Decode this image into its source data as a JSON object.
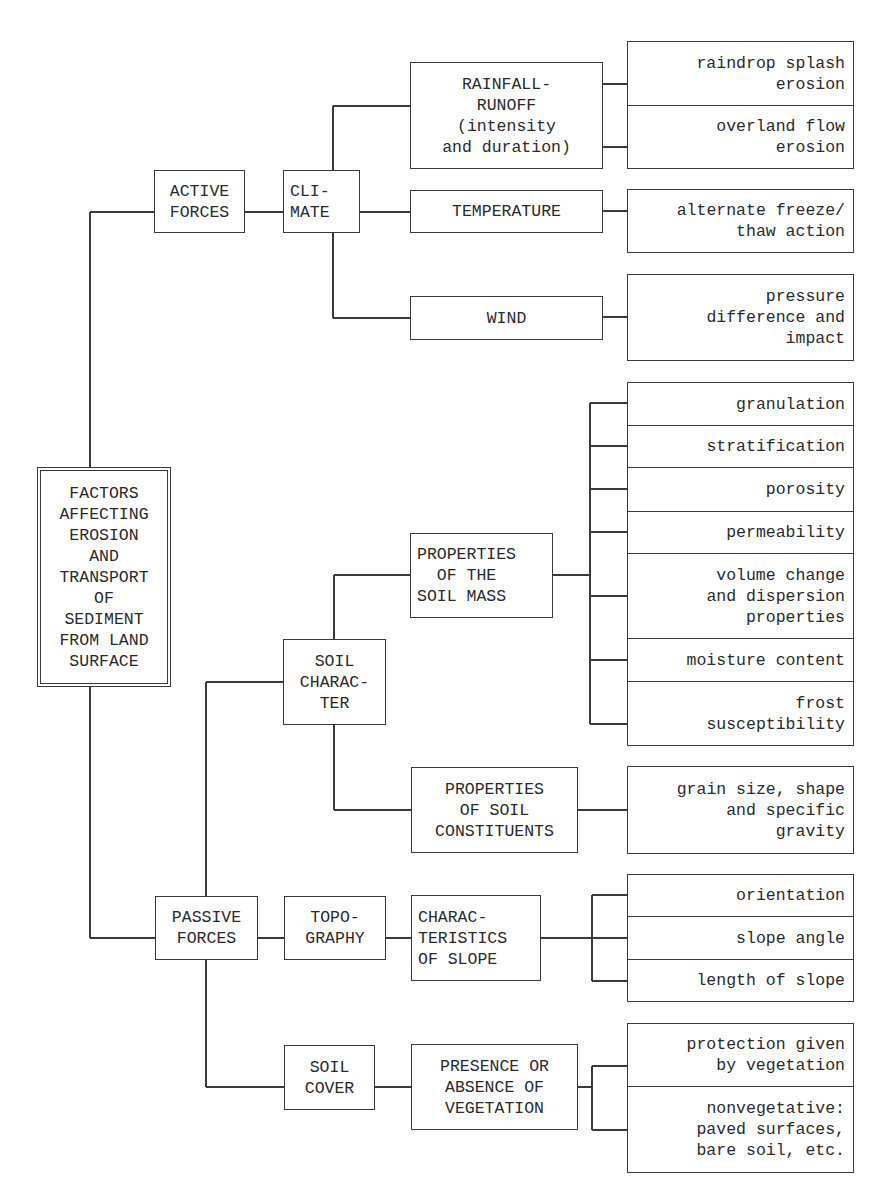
{
  "diagram": {
    "colors": {
      "line": "#3a3a3a",
      "text": "#2a2a2a",
      "background": "#ffffff"
    },
    "nodes": [
      {
        "id": "root",
        "align": "center",
        "double": true,
        "x": 37,
        "y": 467,
        "w": 134,
        "h": 220,
        "lines": [
          "FACTORS",
          "AFFECTING",
          "EROSION",
          "AND",
          "TRANSPORT",
          "OF",
          "SEDIMENT",
          "FROM LAND",
          "SURFACE"
        ]
      },
      {
        "id": "active-forces",
        "align": "center",
        "x": 154,
        "y": 170,
        "w": 91,
        "h": 63,
        "lines": [
          "ACTIVE",
          "FORCES"
        ]
      },
      {
        "id": "climate",
        "align": "left",
        "x": 283,
        "y": 170,
        "w": 77,
        "h": 63,
        "lines": [
          "CLI-",
          "MATE"
        ]
      },
      {
        "id": "rainfall-runoff",
        "align": "center",
        "x": 410,
        "y": 62,
        "w": 193,
        "h": 107,
        "lines": [
          "RAINFALL-",
          "RUNOFF",
          "(intensity",
          "and duration)"
        ]
      },
      {
        "id": "temperature",
        "align": "center",
        "x": 410,
        "y": 190,
        "w": 193,
        "h": 43,
        "lines": [
          "TEMPERATURE"
        ]
      },
      {
        "id": "wind",
        "align": "center",
        "x": 410,
        "y": 296,
        "w": 193,
        "h": 44,
        "lines": [
          "WIND"
        ]
      },
      {
        "id": "raindrop-splash",
        "align": "right",
        "x": 627,
        "y": 41,
        "w": 227,
        "h": 65,
        "lines": [
          "raindrop splash",
          "erosion"
        ]
      },
      {
        "id": "overland-flow",
        "align": "right",
        "x": 627,
        "y": 105,
        "w": 227,
        "h": 64,
        "lines": [
          "overland flow",
          "erosion"
        ]
      },
      {
        "id": "freeze-thaw",
        "align": "right",
        "x": 627,
        "y": 189,
        "w": 227,
        "h": 64,
        "lines": [
          "alternate freeze/",
          "thaw action"
        ]
      },
      {
        "id": "pressure-difference",
        "align": "right",
        "x": 627,
        "y": 274,
        "w": 227,
        "h": 87,
        "lines": [
          "pressure",
          "difference and",
          "impact"
        ]
      },
      {
        "id": "passive-forces",
        "align": "center",
        "x": 155,
        "y": 896,
        "w": 103,
        "h": 64,
        "lines": [
          "PASSIVE",
          "FORCES"
        ]
      },
      {
        "id": "soil-character",
        "align": "center",
        "x": 283,
        "y": 639,
        "w": 103,
        "h": 86,
        "lines": [
          "SOIL",
          "CHARAC-",
          "TER"
        ]
      },
      {
        "id": "soil-mass",
        "align": "left",
        "x": 410,
        "y": 533,
        "w": 143,
        "h": 85,
        "lines": [
          "PROPERTIES",
          "  OF THE",
          "SOIL MASS"
        ]
      },
      {
        "id": "soil-constituents",
        "align": "center",
        "x": 411,
        "y": 767,
        "w": 167,
        "h": 86,
        "lines": [
          "PROPERTIES",
          "OF SOIL",
          "CONSTITUENTS"
        ]
      },
      {
        "id": "granulation",
        "align": "right",
        "x": 627,
        "y": 382,
        "w": 227,
        "h": 44,
        "lines": [
          "granulation"
        ]
      },
      {
        "id": "stratification",
        "align": "right",
        "x": 627,
        "y": 425,
        "w": 227,
        "h": 43,
        "lines": [
          "stratification"
        ]
      },
      {
        "id": "porosity",
        "align": "right",
        "x": 627,
        "y": 467,
        "w": 227,
        "h": 45,
        "lines": [
          "porosity"
        ]
      },
      {
        "id": "permeability",
        "align": "right",
        "x": 627,
        "y": 511,
        "w": 227,
        "h": 43,
        "lines": [
          "permeability"
        ]
      },
      {
        "id": "volume-change",
        "align": "right",
        "x": 627,
        "y": 553,
        "w": 227,
        "h": 86,
        "lines": [
          "volume change",
          "and dispersion",
          "properties"
        ]
      },
      {
        "id": "moisture-content",
        "align": "right",
        "x": 627,
        "y": 638,
        "w": 227,
        "h": 44,
        "lines": [
          "moisture content"
        ]
      },
      {
        "id": "frost-susceptibility",
        "align": "right",
        "x": 627,
        "y": 681,
        "w": 227,
        "h": 65,
        "lines": [
          "frost",
          "susceptibility"
        ]
      },
      {
        "id": "grain-size",
        "align": "right",
        "x": 627,
        "y": 766,
        "w": 227,
        "h": 88,
        "lines": [
          "grain size, shape",
          "and specific",
          "gravity"
        ]
      },
      {
        "id": "topography",
        "align": "center",
        "x": 284,
        "y": 896,
        "w": 102,
        "h": 64,
        "lines": [
          "TOPO-",
          "GRAPHY"
        ]
      },
      {
        "id": "slope-characteristics",
        "align": "left",
        "x": 411,
        "y": 895,
        "w": 130,
        "h": 86,
        "lines": [
          "CHARAC-",
          "TERISTICS",
          "OF SLOPE"
        ]
      },
      {
        "id": "orientation",
        "align": "right",
        "x": 627,
        "y": 874,
        "w": 227,
        "h": 43,
        "lines": [
          "orientation"
        ]
      },
      {
        "id": "slope-angle",
        "align": "right",
        "x": 627,
        "y": 916,
        "w": 227,
        "h": 44,
        "lines": [
          "slope angle"
        ]
      },
      {
        "id": "length-of-slope",
        "align": "right",
        "x": 627,
        "y": 959,
        "w": 227,
        "h": 43,
        "lines": [
          "length of slope"
        ]
      },
      {
        "id": "soil-cover",
        "align": "center",
        "x": 284,
        "y": 1045,
        "w": 91,
        "h": 65,
        "lines": [
          "SOIL",
          "COVER"
        ]
      },
      {
        "id": "vegetation-presence",
        "align": "center",
        "x": 411,
        "y": 1044,
        "w": 167,
        "h": 86,
        "lines": [
          "PRESENCE OR",
          "ABSENCE OF",
          "VEGETATION"
        ]
      },
      {
        "id": "protection-by-vegetation",
        "align": "right",
        "x": 627,
        "y": 1023,
        "w": 227,
        "h": 64,
        "lines": [
          "protection given",
          "by vegetation"
        ]
      },
      {
        "id": "nonvegetative",
        "align": "right",
        "x": 627,
        "y": 1086,
        "w": 227,
        "h": 87,
        "lines": [
          "nonvegetative:",
          "paved surfaces,",
          "bare soil, etc."
        ]
      }
    ],
    "lines": [
      {
        "type": "v",
        "x": 90,
        "y1": 212,
        "y2": 467
      },
      {
        "type": "h",
        "y": 212,
        "x1": 90,
        "x2": 154
      },
      {
        "type": "v",
        "x": 90,
        "y1": 687,
        "y2": 938
      },
      {
        "type": "h",
        "y": 938,
        "x1": 90,
        "x2": 155
      },
      {
        "type": "h",
        "y": 212,
        "x1": 245,
        "x2": 283
      },
      {
        "type": "v",
        "x": 333,
        "y1": 106,
        "y2": 170
      },
      {
        "type": "h",
        "y": 106,
        "x1": 333,
        "x2": 410
      },
      {
        "type": "h",
        "y": 212,
        "x1": 360,
        "x2": 410
      },
      {
        "type": "v",
        "x": 333,
        "y1": 233,
        "y2": 318
      },
      {
        "type": "h",
        "y": 318,
        "x1": 333,
        "x2": 410
      },
      {
        "type": "h",
        "y": 84,
        "x1": 603,
        "x2": 627
      },
      {
        "type": "h",
        "y": 147,
        "x1": 603,
        "x2": 627
      },
      {
        "type": "h",
        "y": 211,
        "x1": 603,
        "x2": 627
      },
      {
        "type": "h",
        "y": 317,
        "x1": 603,
        "x2": 627
      },
      {
        "type": "v",
        "x": 206,
        "y1": 682,
        "y2": 896
      },
      {
        "type": "h",
        "y": 682,
        "x1": 206,
        "x2": 283
      },
      {
        "type": "v",
        "x": 334,
        "y1": 575,
        "y2": 639
      },
      {
        "type": "h",
        "y": 575,
        "x1": 334,
        "x2": 410
      },
      {
        "type": "v",
        "x": 334,
        "y1": 725,
        "y2": 810
      },
      {
        "type": "h",
        "y": 810,
        "x1": 334,
        "x2": 411
      },
      {
        "type": "h",
        "y": 575,
        "x1": 553,
        "x2": 590
      },
      {
        "type": "v",
        "x": 590,
        "y1": 403,
        "y2": 724
      },
      {
        "type": "h",
        "y": 403,
        "x1": 590,
        "x2": 627
      },
      {
        "type": "h",
        "y": 446,
        "x1": 590,
        "x2": 627
      },
      {
        "type": "h",
        "y": 489,
        "x1": 590,
        "x2": 627
      },
      {
        "type": "h",
        "y": 532,
        "x1": 590,
        "x2": 627
      },
      {
        "type": "h",
        "y": 596,
        "x1": 590,
        "x2": 627
      },
      {
        "type": "h",
        "y": 660,
        "x1": 590,
        "x2": 627
      },
      {
        "type": "h",
        "y": 724,
        "x1": 590,
        "x2": 627
      },
      {
        "type": "h",
        "y": 810,
        "x1": 578,
        "x2": 627
      },
      {
        "type": "h",
        "y": 938,
        "x1": 258,
        "x2": 284
      },
      {
        "type": "h",
        "y": 938,
        "x1": 386,
        "x2": 411
      },
      {
        "type": "h",
        "y": 938,
        "x1": 541,
        "x2": 627
      },
      {
        "type": "v",
        "x": 592,
        "y1": 895,
        "y2": 981
      },
      {
        "type": "h",
        "y": 895,
        "x1": 592,
        "x2": 627
      },
      {
        "type": "h",
        "y": 981,
        "x1": 592,
        "x2": 627
      },
      {
        "type": "v",
        "x": 206,
        "y1": 960,
        "y2": 1087
      },
      {
        "type": "h",
        "y": 1087,
        "x1": 206,
        "x2": 284
      },
      {
        "type": "h",
        "y": 1087,
        "x1": 375,
        "x2": 411
      },
      {
        "type": "h",
        "y": 1087,
        "x1": 578,
        "x2": 592
      },
      {
        "type": "v",
        "x": 592,
        "y1": 1066,
        "y2": 1130
      },
      {
        "type": "h",
        "y": 1066,
        "x1": 592,
        "x2": 627
      },
      {
        "type": "h",
        "y": 1130,
        "x1": 592,
        "x2": 627
      }
    ]
  }
}
